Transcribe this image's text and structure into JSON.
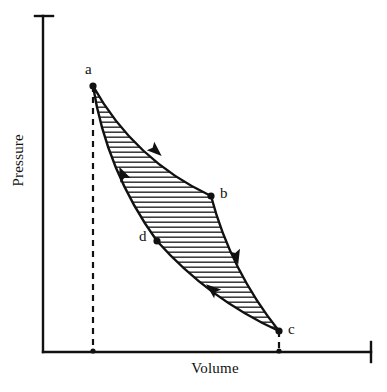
{
  "figure": {
    "type": "pv-diagram",
    "background_color": "#ffffff",
    "line_color": "#111111",
    "hatch_color": "#333333",
    "width": 387,
    "height": 392
  },
  "axes": {
    "x_title": "Volume",
    "y_title": "Pressure",
    "x_axis": {
      "y": 352,
      "x_start": 43,
      "x_end": 371,
      "end_cap": true
    },
    "y_axis": {
      "x": 43,
      "y_start": 16,
      "y_end": 352,
      "top_cap": true
    },
    "tick_labels_x": [],
    "tick_labels_y": []
  },
  "chart_data": {
    "type": "line",
    "title": "",
    "xlabel": "Volume",
    "ylabel": "Pressure",
    "grid": false,
    "legend": "none",
    "axis_ticks": "none",
    "points": [
      {
        "name": "a",
        "x": 93,
        "y": 86,
        "label": "a",
        "label_x": 85,
        "label_y": 62,
        "dashed_drop": true
      },
      {
        "name": "b",
        "x": 211,
        "y": 196,
        "label": "b",
        "label_x": 220,
        "label_y": 186,
        "dashed_drop": false
      },
      {
        "name": "c",
        "x": 279,
        "y": 331,
        "label": "c",
        "label_x": 288,
        "label_y": 322,
        "dashed_drop": true
      },
      {
        "name": "d",
        "x": 157,
        "y": 241,
        "label": "d",
        "label_x": 139,
        "label_y": 229,
        "dashed_drop": false
      }
    ],
    "cycle_order": [
      "a",
      "b",
      "c",
      "d",
      "a"
    ],
    "curves": [
      {
        "name": "a-to-b",
        "from": "a",
        "to": "b",
        "direction": "forward",
        "concavity": "concave-up"
      },
      {
        "name": "b-to-c",
        "from": "b",
        "to": "c",
        "direction": "forward",
        "concavity": "concave-up"
      },
      {
        "name": "c-to-d",
        "from": "c",
        "to": "d",
        "direction": "forward",
        "concavity": "concave-up"
      },
      {
        "name": "d-to-a",
        "from": "d",
        "to": "a",
        "direction": "forward",
        "concavity": "concave-up"
      }
    ],
    "arrows": [
      {
        "on": "a-to-b",
        "x": 155,
        "y": 150,
        "angle_deg": 42,
        "points_toward": "b"
      },
      {
        "on": "b-to-c",
        "x": 236,
        "y": 256,
        "angle_deg": 76,
        "points_toward": "c"
      },
      {
        "on": "c-to-d",
        "x": 213,
        "y": 290,
        "angle_deg": 219,
        "points_toward": "d"
      },
      {
        "on": "d-to-a",
        "x": 123,
        "y": 175,
        "angle_deg": 245,
        "points_toward": "a"
      }
    ],
    "shaded_region": {
      "enclosed_by": [
        "a",
        "b",
        "c",
        "d"
      ],
      "fill": "horizontal-hatch",
      "hatch_spacing_px": 5
    }
  }
}
